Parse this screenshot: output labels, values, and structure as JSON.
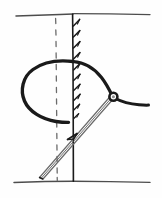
{
  "figure": {
    "title": "Stitch and needle diagram",
    "style": "vintage line engraving",
    "background_color": "#fefefe",
    "ink_color": "#1a1a1a",
    "soft_ink_color": "#4d4d4d",
    "gray_ink_color": "#6b6b6b",
    "width": 162,
    "height": 198,
    "elements": [
      {
        "name": "top-horizontal-edge",
        "label": "upper surface line",
        "description": "thin horizontal rule near the top of the plate"
      },
      {
        "name": "bottom-horizontal-edge",
        "label": "lower surface line",
        "description": "thin horizontal rule near the bottom of the plate"
      },
      {
        "name": "vertical-seam-line",
        "label": "vertical seam edge",
        "description": "solid vertical line from top rule to bottom rule"
      },
      {
        "name": "hatch-marks",
        "label": "hatching along seam",
        "count": 10,
        "description": "short diagonal ticks on the right of the seam"
      },
      {
        "name": "dashed-guide-line",
        "label": "dashed guide",
        "dash_count": 14,
        "description": "vertical dashed line left of the seam"
      },
      {
        "name": "thread-loop",
        "label": "thread loop",
        "description": "thick rounded loop of thread spanning the seam"
      },
      {
        "name": "thread-tail",
        "label": "thread tail",
        "description": "thread running right from the needle eye"
      },
      {
        "name": "needle-eye",
        "label": "needle eye",
        "description": "small ring where thread passes through needle"
      },
      {
        "name": "needle-shaft",
        "label": "needle shaft",
        "description": "double thin line running diagonally lower-left to upper-right"
      },
      {
        "name": "needle-barb",
        "label": "needle barb",
        "description": "small arrow mark where needle crosses the seam"
      }
    ]
  }
}
